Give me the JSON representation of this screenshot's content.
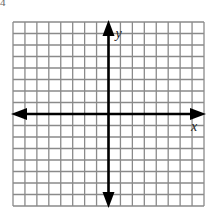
{
  "diagram": {
    "type": "coordinate-grid",
    "problem_number_fragment": "4",
    "grid": {
      "columns": 16,
      "rows": 16,
      "left": 13,
      "top": 22,
      "right": 204,
      "bottom": 206,
      "line_color": "#8a8a8a"
    },
    "axes": {
      "x_label": "x",
      "y_label": "y",
      "axis_color": "#000000",
      "x_axis_row_index": 8,
      "y_axis_col_index": 8
    }
  }
}
